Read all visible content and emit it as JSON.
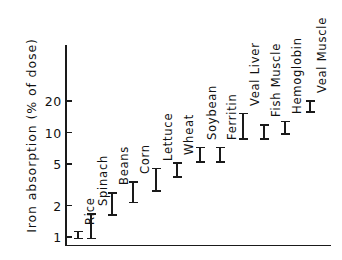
{
  "chart_data": {
    "type": "scatter",
    "title": "",
    "xlabel": "",
    "ylabel": "Iron absorption (% of dose)",
    "yscale": "log",
    "ylim": [
      0.9,
      30
    ],
    "ytick_labels": [
      "20",
      "10",
      "5",
      "2",
      "1"
    ],
    "ytick_values": [
      20,
      10,
      5,
      2,
      1
    ],
    "grid": false,
    "legend": null,
    "error_bar_note": "Each marker is a vertical range (mean with error bar) of iron absorption as percent of dose.",
    "categories": [
      "Rice",
      "Spinach",
      "Beans",
      "Corn",
      "Lettuce",
      "Wheat",
      "Soybean",
      "Ferritin",
      "Veal Liver",
      "Fish Muscle",
      "Hemoglobin",
      "Veal Muscle"
    ],
    "points": [
      {
        "label": "Rice",
        "low": 0.95,
        "high": 1.15,
        "center": 1.05
      },
      {
        "label": "Spinach",
        "low": 0.95,
        "high": 1.7,
        "center": 1.3
      },
      {
        "label": "Beans",
        "low": 1.6,
        "high": 2.7,
        "center": 2.1
      },
      {
        "label": "Corn",
        "low": 2.1,
        "high": 3.4,
        "center": 2.7
      },
      {
        "label": "Lettuce",
        "low": 2.7,
        "high": 4.6,
        "center": 3.5
      },
      {
        "label": "Wheat",
        "low": 3.7,
        "high": 5.2,
        "center": 4.4
      },
      {
        "label": "Soybean",
        "low": 5.1,
        "high": 7.3,
        "center": 6.1
      },
      {
        "label": "Ferritin",
        "low": 5.1,
        "high": 7.3,
        "center": 6.1
      },
      {
        "label": "Veal Liver",
        "low": 8.5,
        "high": 15.5,
        "center": 11.5
      },
      {
        "label": "Fish Muscle",
        "low": 8.5,
        "high": 12.0,
        "center": 10.2
      },
      {
        "label": "Hemoglobin",
        "low": 9.5,
        "high": 13.0,
        "center": 11.0
      },
      {
        "label": "Veal Muscle",
        "low": 15.5,
        "high": 20.5,
        "center": 17.8
      }
    ]
  }
}
